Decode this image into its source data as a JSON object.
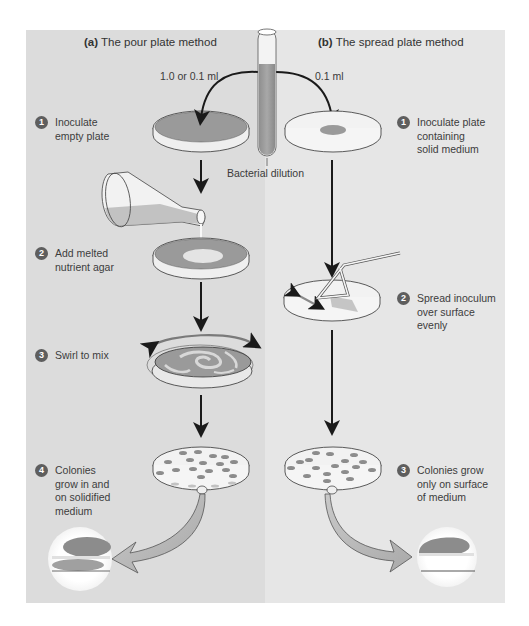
{
  "panels": {
    "a": {
      "title_prefix": "(a)",
      "title": "The pour plate method",
      "volume_label": "1.0 or 0.1 ml",
      "background": "#dcdcdc",
      "steps": [
        {
          "number": "1",
          "text": "Inoculate\nempty plate"
        },
        {
          "number": "2",
          "text": "Add melted\nnutrient agar"
        },
        {
          "number": "3",
          "text": "Swirl to mix"
        },
        {
          "number": "4",
          "text": "Colonies\ngrow in and\non solidified\nmedium"
        }
      ]
    },
    "b": {
      "title_prefix": "(b)",
      "title": "The spread plate method",
      "volume_label": "0.1 ml",
      "background": "#e6e6e6",
      "steps": [
        {
          "number": "1",
          "text": "Inoculate plate\ncontaining\nsolid medium"
        },
        {
          "number": "2",
          "text": "Spread inoculum\nover surface\nevenly"
        },
        {
          "number": "3",
          "text": "Colonies grow\nonly on surface\nof medium"
        }
      ]
    }
  },
  "tube_label": "Bacterial dilution",
  "colors": {
    "agar": "#9a9a9a",
    "colony": "#8c8c8c",
    "arrow": "#1a1a1a",
    "badge": "#5e5e5e",
    "light_fill": "#f2f2f2"
  },
  "icons": {
    "test_tube": "test-tube-icon",
    "flask": "flask-icon",
    "petri_dish": "petri-dish-icon",
    "spreader": "spreader-rod-icon",
    "magnifier": "magnified-view-icon"
  }
}
